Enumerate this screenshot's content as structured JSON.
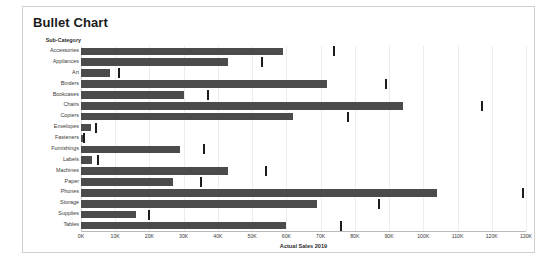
{
  "panel": {
    "title": "Bullet Chart"
  },
  "chart_data": {
    "type": "bar",
    "title": "Bullet Chart",
    "subtitle": "",
    "xlabel": "Actual Sales 2019",
    "ylabel": "Sub-Category",
    "xlim": [
      0,
      130000
    ],
    "grid": true,
    "legend": "none",
    "orientation": "horizontal",
    "xtick_labels": [
      "0K",
      "10K",
      "20K",
      "30K",
      "40K",
      "50K",
      "60K",
      "70K",
      "80K",
      "90K",
      "100K",
      "110K",
      "120K",
      "130K"
    ],
    "xtick_values": [
      0,
      10000,
      20000,
      30000,
      40000,
      50000,
      60000,
      70000,
      80000,
      90000,
      100000,
      110000,
      120000,
      130000
    ],
    "categories": [
      "Accessories",
      "Appliances",
      "Art",
      "Binders",
      "Bookcases",
      "Chairs",
      "Copiers",
      "Envelopes",
      "Fasteners",
      "Furnishings",
      "Labels",
      "Machines",
      "Paper",
      "Phones",
      "Storage",
      "Supplies",
      "Tables"
    ],
    "series": [
      {
        "name": "Actual Sales 2019",
        "values": [
          59000,
          43000,
          8500,
          72000,
          30000,
          94000,
          62000,
          3000,
          600,
          29000,
          3200,
          43000,
          27000,
          104000,
          69000,
          16000,
          60000
        ]
      },
      {
        "name": "Target",
        "values": [
          74000,
          53000,
          11000,
          89000,
          37000,
          117000,
          78000,
          4500,
          1000,
          36000,
          5000,
          54000,
          35000,
          129000,
          87000,
          20000,
          76000
        ]
      }
    ],
    "colors": {
      "bar": "#4b4b4b",
      "marker": "#1c1c1c",
      "gridline": "#ededed",
      "axis": "#b9b9b9",
      "panel_border": "#cfcfcf",
      "background": "#ffffff",
      "title_text": "#1a1a1a",
      "label_text": "#3a3a3a"
    }
  }
}
